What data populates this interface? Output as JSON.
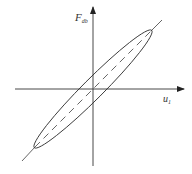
{
  "diagram": {
    "type": "hysteresis-loop",
    "y_axis": {
      "label_main": "F",
      "label_sub": "db"
    },
    "x_axis": {
      "label_main": "u",
      "label_sub": "1"
    },
    "colors": {
      "line": "#333333",
      "background": "#ffffff"
    },
    "elements": [
      "vertical axis with arrow",
      "horizontal axis with arrow",
      "tilted elongated ellipse (loop)",
      "diagonal line through origin, dashed inside loop"
    ]
  }
}
